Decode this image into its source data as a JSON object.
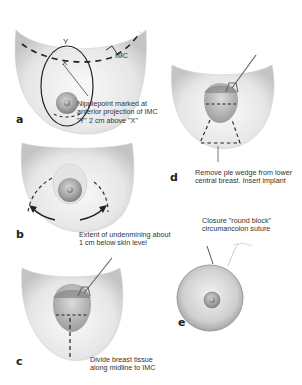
{
  "figure": {
    "panels": [
      {
        "id": "a",
        "letter": "a",
        "caption_lines": [
          "Nipplepoint marked at",
          "anterior projection of IMC",
          "\"Y\" 2 cm above \"X\""
        ],
        "labels": {
          "y": "Y",
          "x": "X",
          "imc": "IMC"
        }
      },
      {
        "id": "b",
        "letter": "b",
        "caption_lines": [
          "Extent of undenmining about",
          "1 cm below skin level"
        ]
      },
      {
        "id": "c",
        "letter": "c",
        "caption_lines": [
          "Divide breast tissue",
          "along midline to IMC"
        ]
      },
      {
        "id": "d",
        "letter": "d",
        "caption_lines": [
          "Remove pie wedge from lower",
          "central breast. Insert implant"
        ]
      },
      {
        "id": "e",
        "letter": "e",
        "caption_lines": [
          "Closure \"round block\"",
          "circumancolon suture"
        ]
      }
    ],
    "colors": {
      "skin_light": "#f4f4f4",
      "skin_shade": "#c8c8c8",
      "areola": "#9a9a9a",
      "line": "#222222",
      "text": "#333333"
    }
  }
}
